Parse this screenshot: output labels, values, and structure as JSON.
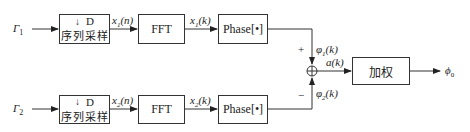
{
  "diagram": {
    "inputs": [
      {
        "label": "Γ",
        "sub": "1"
      },
      {
        "label": "Γ",
        "sub": "2"
      }
    ],
    "channels": [
      {
        "sampler": {
          "delay": "D",
          "name": "序列采样"
        },
        "sample_signal": {
          "main": "x",
          "sub": "1",
          "arg": "(n)"
        },
        "fft_label": "FFT",
        "fft_signal": {
          "main": "x",
          "sub": "1",
          "arg": "(k)"
        },
        "phase_label": "Phase[•]",
        "phase_signal": {
          "main": "φ",
          "sub": "1",
          "arg": "(k)"
        },
        "sign": "+"
      },
      {
        "sampler": {
          "delay": "D",
          "name": "序列采样"
        },
        "sample_signal": {
          "main": "x",
          "sub": "2",
          "arg": "(n)"
        },
        "fft_label": "FFT",
        "fft_signal": {
          "main": "x",
          "sub": "2",
          "arg": "(k)"
        },
        "phase_label": "Phase[•]",
        "phase_signal": {
          "main": "φ",
          "sub": "2",
          "arg": "(k)"
        },
        "sign": "−"
      }
    ],
    "sum_signal": {
      "main": "a",
      "arg": "(k)"
    },
    "weight_label": "加权",
    "output": {
      "main": "ϕ",
      "sub": "0"
    }
  }
}
